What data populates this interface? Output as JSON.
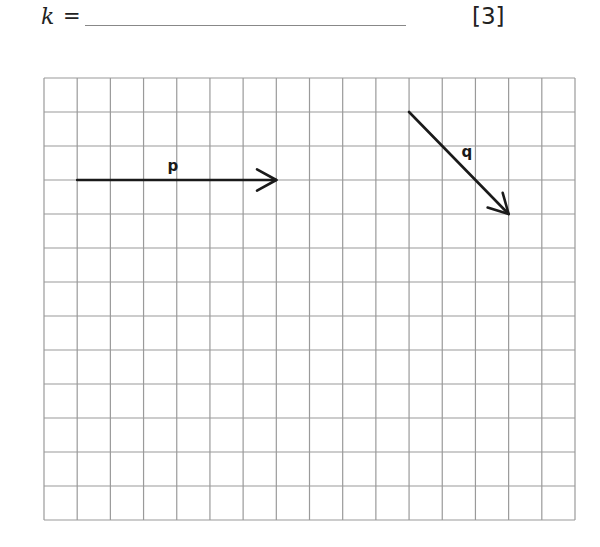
{
  "question": {
    "variable": "k",
    "equals": "=",
    "marks": "[3]"
  },
  "grid": {
    "columns": 16,
    "rows": 13,
    "line_color": "#9a9a9a"
  },
  "vectors": [
    {
      "label": "p",
      "from": [
        1,
        3
      ],
      "to": [
        7,
        3
      ],
      "components": [
        6,
        0
      ]
    },
    {
      "label": "q",
      "from": [
        11,
        1
      ],
      "to": [
        14,
        4
      ],
      "components": [
        3,
        -3
      ]
    }
  ]
}
